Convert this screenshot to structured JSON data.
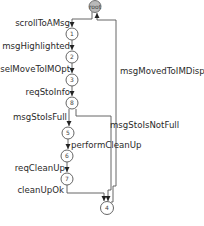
{
  "diagram": {
    "type": "state-transition-graph",
    "root": {
      "id": "root",
      "label": "root",
      "fill": "#b9b9b9"
    },
    "nodes": [
      {
        "id": "1",
        "label": "1"
      },
      {
        "id": "2",
        "label": "2"
      },
      {
        "id": "3",
        "label": "3"
      },
      {
        "id": "8",
        "label": "8"
      },
      {
        "id": "5",
        "label": "5"
      },
      {
        "id": "6",
        "label": "6"
      },
      {
        "id": "7",
        "label": "7"
      },
      {
        "id": "4",
        "label": "4"
      }
    ],
    "edges": [
      {
        "from": "root",
        "to": "1",
        "label": "scrollToAMsg"
      },
      {
        "from": "1",
        "to": "2",
        "label": "msgHighlighted"
      },
      {
        "from": "2",
        "to": "3",
        "label": "selMoveToIMOpt"
      },
      {
        "from": "3",
        "to": "8",
        "label": "reqStoInfo"
      },
      {
        "from": "8",
        "to": "5",
        "label": "msgStoIsFull"
      },
      {
        "from": "5",
        "to": "6",
        "label": "performCleanUp"
      },
      {
        "from": "6",
        "to": "7",
        "label": "reqCleanUp"
      },
      {
        "from": "7",
        "to": "4",
        "label": "cleanUpOk"
      },
      {
        "from": "8",
        "to": "4",
        "label": "msgStoIsNotFull"
      },
      {
        "from": "4",
        "to": "root",
        "label": "msgMovedToIMDisp"
      }
    ]
  }
}
